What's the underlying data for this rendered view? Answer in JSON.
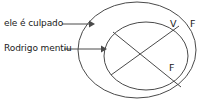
{
  "diagram": {
    "type": "venn-nested-ellipses",
    "stroke_color": "#4a4a4a",
    "text_color": "#1a1a1a",
    "background_color": "#ffffff",
    "labels": {
      "outer_proposition": "ele é culpado",
      "inner_proposition": "Rodrigo mentiu",
      "truth_value_v": "V",
      "truth_value_f_top": "F",
      "truth_value_f_bottom": "F"
    },
    "shapes": {
      "outer_ellipse": {
        "cx": 137,
        "cy": 50,
        "rx": 59,
        "ry": 48
      },
      "inner_ellipse": {
        "cx": 146,
        "cy": 56,
        "rx": 42,
        "ry": 34
      },
      "chord_1": {
        "x1": 113,
        "y1": 32,
        "x2": 180,
        "y2": 86
      },
      "chord_2": {
        "x1": 112,
        "y1": 74,
        "x2": 178,
        "y2": 27
      }
    },
    "arrows": [
      {
        "name": "arrow-to-outer",
        "x1": 62,
        "y1": 24,
        "x2": 92,
        "y2": 24
      },
      {
        "name": "arrow-to-inner",
        "x1": 64,
        "y1": 49,
        "x2": 104,
        "y2": 49
      }
    ]
  }
}
